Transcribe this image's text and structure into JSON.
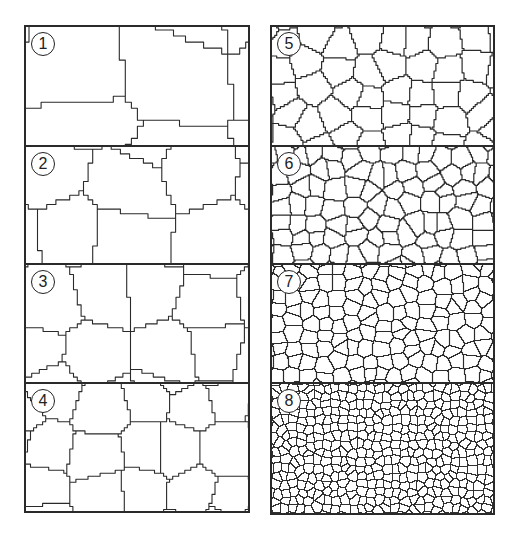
{
  "figure": {
    "stroke_color": "#2a2a2a",
    "background": "#ffffff"
  },
  "columns": [
    {
      "panels": [
        {
          "label": "1",
          "grains_x": 2.2,
          "grains_y": 1.4,
          "seed": 11
        },
        {
          "label": "2",
          "grains_x": 3.0,
          "grains_y": 1.8,
          "seed": 23
        },
        {
          "label": "3",
          "grains_x": 4.0,
          "grains_y": 2.2,
          "seed": 37
        },
        {
          "label": "4",
          "grains_x": 5.0,
          "grains_y": 3.0,
          "seed": 41
        }
      ]
    },
    {
      "panels": [
        {
          "label": "5",
          "grains_x": 8,
          "grains_y": 4.5,
          "seed": 53
        },
        {
          "label": "6",
          "grains_x": 12,
          "grains_y": 7,
          "seed": 67
        },
        {
          "label": "7",
          "grains_x": 15,
          "grains_y": 9,
          "seed": 71
        },
        {
          "label": "8",
          "grains_x": 26,
          "grains_y": 16,
          "seed": 89
        }
      ]
    }
  ]
}
